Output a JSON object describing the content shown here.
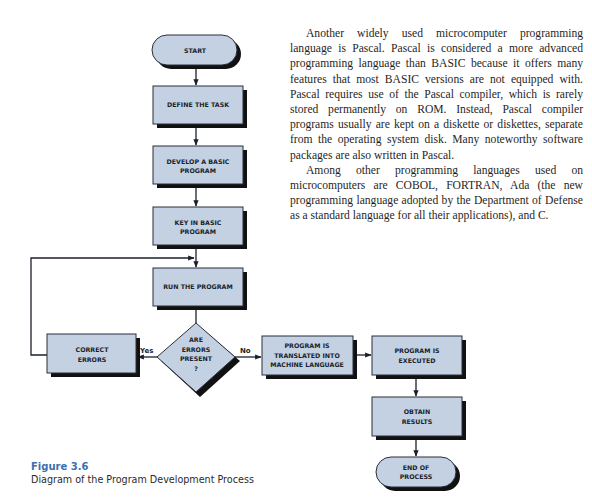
{
  "figure": {
    "number": "Figure 3.6",
    "title": "Diagram of the Program Development Process",
    "colors": {
      "box_fill": "#c3d1e3",
      "box_stroke": "#2a2f3a",
      "shadow": "#111111",
      "caption_accent": "#3b6fb0"
    },
    "nodes": {
      "start": {
        "type": "terminator",
        "lines": [
          "START"
        ]
      },
      "define": {
        "type": "process",
        "lines": [
          "DEFINE THE TASK"
        ]
      },
      "develop": {
        "type": "process",
        "lines": [
          "DEVELOP A BASIC",
          "PROGRAM"
        ]
      },
      "keyin": {
        "type": "process",
        "lines": [
          "KEY IN BASIC",
          "PROGRAM"
        ]
      },
      "run": {
        "type": "process",
        "lines": [
          "RUN THE PROGRAM"
        ]
      },
      "decision": {
        "type": "decision",
        "lines": [
          "ARE",
          "ERRORS",
          "PRESENT",
          "?"
        ]
      },
      "correct": {
        "type": "process",
        "lines": [
          "CORRECT",
          "ERRORS"
        ]
      },
      "translate": {
        "type": "process",
        "lines": [
          "PROGRAM IS",
          "TRANSLATED INTO",
          "MACHINE LANGUAGE"
        ]
      },
      "executed": {
        "type": "process",
        "lines": [
          "PROGRAM IS",
          "EXECUTED"
        ]
      },
      "results": {
        "type": "process",
        "lines": [
          "OBTAIN",
          "RESULTS"
        ]
      },
      "end": {
        "type": "terminator",
        "lines": [
          "END OF",
          "PROCESS"
        ]
      }
    },
    "branches": {
      "yes": "Yes",
      "no": "No"
    },
    "edges": [
      [
        "start",
        "define"
      ],
      [
        "define",
        "develop"
      ],
      [
        "develop",
        "keyin"
      ],
      [
        "keyin",
        "run"
      ],
      [
        "run",
        "decision"
      ],
      [
        "decision",
        "correct",
        "Yes"
      ],
      [
        "correct",
        "run"
      ],
      [
        "decision",
        "translate",
        "No"
      ],
      [
        "translate",
        "executed"
      ],
      [
        "executed",
        "results"
      ],
      [
        "results",
        "end"
      ]
    ]
  },
  "text": {
    "paragraphs": [
      "Another widely used microcomputer programming language is Pascal. Pascal is considered a more advanced programming language than BASIC because it offers many features that most BASIC versions are not equipped with. Pascal requires use of the Pascal compiler, which is rarely stored permanently on ROM. Instead, Pascal compiler programs usually are kept on a diskette or diskettes, separate from the operating system disk. Many noteworthy software packages are also written in Pascal.",
      "Among other programming languages used on microcomputers are COBOL, FORTRAN, Ada (the new programming language adopted by the Department of Defense as a standard language for all their applications), and C."
    ]
  }
}
